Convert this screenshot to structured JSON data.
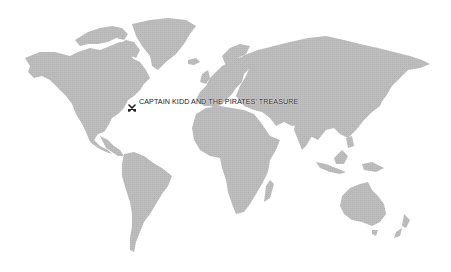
{
  "map": {
    "style": "dotted world map",
    "colors": {
      "land": "#bcbcbc",
      "ocean": "#ffffff",
      "label": "#222222"
    },
    "regions": [
      "North America",
      "Greenland",
      "South America",
      "Europe",
      "Africa",
      "Asia",
      "Australia",
      "New Zealand"
    ]
  },
  "marker": {
    "icon": "crossed-swords-icon",
    "label": "CAPTAIN KIDD AND THE PIRATES' TREASURE"
  }
}
